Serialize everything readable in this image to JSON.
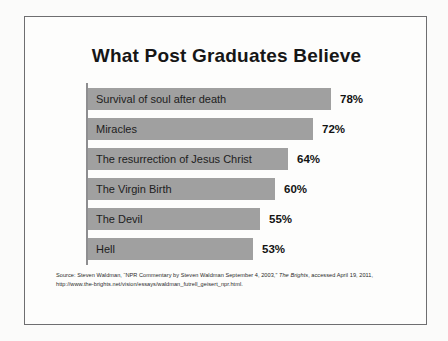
{
  "slide": {
    "title": "What Post Graduates Believe",
    "source_prefix": "Source: Steven Waldman, “NPR Commentary by Steven Waldman September 4, 2003,” ",
    "source_italic": "The Brights",
    "source_suffix": ", accessed April 19, 2011, http://www.the-brights.net/vision/essays/waldman_futrell_geisert_npr.html."
  },
  "colors": {
    "bar_fill": "#a0a0a0",
    "axis": "#8e8e90",
    "frame": "#6e6e70",
    "text": "#1d1d1d",
    "page_background": "#fbfbfa"
  },
  "chart_data": {
    "type": "bar",
    "orientation": "horizontal",
    "title": "What Post Graduates Believe",
    "xlabel": "",
    "ylabel": "",
    "xlim": [
      0,
      100
    ],
    "grid": false,
    "legend": false,
    "value_suffix": "%",
    "categories": [
      "Survival of soul after death",
      "Miracles",
      "The resurrection of Jesus Christ",
      "The Virgin Birth",
      "The Devil",
      "Hell"
    ],
    "values": [
      78,
      72,
      64,
      60,
      55,
      53
    ],
    "value_labels": [
      "78%",
      "72%",
      "64%",
      "60%",
      "55%",
      "53%"
    ]
  }
}
